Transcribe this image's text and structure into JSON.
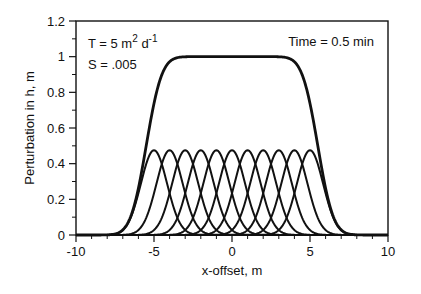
{
  "chart_data": {
    "type": "line",
    "title": "",
    "xlabel": "x-offset, m",
    "ylabel": "Perturbation in h, m",
    "xlim": [
      -10,
      10
    ],
    "ylim": [
      0,
      1.2
    ],
    "xticks": [
      -10,
      -5,
      0,
      5,
      10
    ],
    "xtick_labels": [
      "-10",
      "-5",
      "0",
      "5",
      "10"
    ],
    "yticks": [
      0,
      0.2,
      0.4,
      0.6,
      0.8,
      1,
      1.2
    ],
    "ytick_labels": [
      "0",
      "0.2",
      "0.4",
      "0.6",
      "0.8",
      "1",
      "1.2"
    ],
    "grid": false,
    "legend": null,
    "annotations": {
      "T": "T = 5 m",
      "T_exp1": "2",
      "T_unit": " d",
      "T_exp2": "-1",
      "S": "S = .005",
      "time": "Time = 0.5 min"
    },
    "series": [
      {
        "name": "individual pulse x0=-5",
        "center": -5,
        "peak": 0.475,
        "sigma": 0.84
      },
      {
        "name": "individual pulse x0=-4",
        "center": -4,
        "peak": 0.475,
        "sigma": 0.84
      },
      {
        "name": "individual pulse x0=-3",
        "center": -3,
        "peak": 0.475,
        "sigma": 0.84
      },
      {
        "name": "individual pulse x0=-2",
        "center": -2,
        "peak": 0.475,
        "sigma": 0.84
      },
      {
        "name": "individual pulse x0=-1",
        "center": -1,
        "peak": 0.475,
        "sigma": 0.84
      },
      {
        "name": "individual pulse x0=0",
        "center": 0,
        "peak": 0.475,
        "sigma": 0.84
      },
      {
        "name": "individual pulse x0=1",
        "center": 1,
        "peak": 0.475,
        "sigma": 0.84
      },
      {
        "name": "individual pulse x0=2",
        "center": 2,
        "peak": 0.475,
        "sigma": 0.84
      },
      {
        "name": "individual pulse x0=3",
        "center": 3,
        "peak": 0.475,
        "sigma": 0.84
      },
      {
        "name": "individual pulse x0=4",
        "center": 4,
        "peak": 0.475,
        "sigma": 0.84
      },
      {
        "name": "individual pulse x0=5",
        "center": 5,
        "peak": 0.475,
        "sigma": 0.84
      },
      {
        "name": "superposition (sum)",
        "x": [
          -10,
          -8,
          -7,
          -6.5,
          -6,
          -5.5,
          -5,
          -4.5,
          -4,
          0,
          4,
          4.5,
          5,
          5.5,
          6,
          6.5,
          7,
          8,
          10
        ],
        "values": [
          0,
          0.005,
          0.03,
          0.08,
          0.19,
          0.37,
          0.6,
          0.83,
          0.97,
          1.0,
          0.97,
          0.83,
          0.6,
          0.37,
          0.19,
          0.08,
          0.03,
          0.005,
          0
        ]
      }
    ]
  }
}
